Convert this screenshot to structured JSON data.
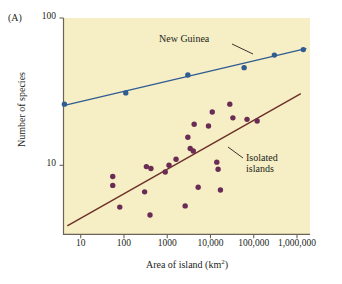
{
  "figure": {
    "panel_letter": "(A)",
    "xlabel_text": "Area of island (km",
    "xlabel_unit": "2",
    "xlabel_close": ")",
    "ylabel": "Number of species",
    "plot_bg_color": "#f6eec4",
    "axis_color": "#6b6456"
  },
  "annotations": {
    "new_guinea": "New Guinea",
    "isolated_line1": "Isolated",
    "isolated_line2": "islands"
  },
  "chart_data": {
    "type": "scatter",
    "title": "",
    "xlabel": "Area of island (km2)",
    "ylabel": "Number of species",
    "xscale": "log",
    "yscale": "log",
    "xlim": [
      4,
      2000000
    ],
    "ylim": [
      3.4,
      100
    ],
    "grid": false,
    "legend": "inline-annotations",
    "xticks": [
      10,
      100,
      1000,
      10000,
      100000,
      1000000
    ],
    "xticklabels": [
      "10",
      "100",
      "1000",
      "10,000",
      "100,000",
      "1,000,000"
    ],
    "yticks": [
      10,
      100
    ],
    "yticklabels": [
      "10",
      "100"
    ],
    "series": [
      {
        "name": "New Guinea",
        "color": "#2f5c93",
        "marker": "circle",
        "points": [
          {
            "x": 4.2,
            "y": 26
          },
          {
            "x": 110,
            "y": 31
          },
          {
            "x": 3000,
            "y": 41
          },
          {
            "x": 60000,
            "y": 46
          },
          {
            "x": 300000,
            "y": 56
          },
          {
            "x": 1400000,
            "y": 61
          }
        ],
        "trendline": {
          "x1": 4.2,
          "y1": 25.5,
          "x2": 1600000,
          "y2": 62,
          "color": "#2f5c93"
        }
      },
      {
        "name": "Isolated islands",
        "color": "#6a2c55",
        "marker": "circle",
        "points": [
          {
            "x": 55,
            "y": 8.4
          },
          {
            "x": 55,
            "y": 7.3
          },
          {
            "x": 80,
            "y": 5.2
          },
          {
            "x": 300,
            "y": 6.6
          },
          {
            "x": 330,
            "y": 9.8
          },
          {
            "x": 420,
            "y": 9.5
          },
          {
            "x": 400,
            "y": 4.6
          },
          {
            "x": 900,
            "y": 9.0
          },
          {
            "x": 1100,
            "y": 10.0
          },
          {
            "x": 1600,
            "y": 11.0
          },
          {
            "x": 2600,
            "y": 5.3
          },
          {
            "x": 3000,
            "y": 15.5
          },
          {
            "x": 3400,
            "y": 13.0
          },
          {
            "x": 4000,
            "y": 12.5
          },
          {
            "x": 4200,
            "y": 19.0
          },
          {
            "x": 5200,
            "y": 7.1
          },
          {
            "x": 9000,
            "y": 18.5
          },
          {
            "x": 11000,
            "y": 23.0
          },
          {
            "x": 14000,
            "y": 10.5
          },
          {
            "x": 15000,
            "y": 9.4
          },
          {
            "x": 17000,
            "y": 6.8
          },
          {
            "x": 28000,
            "y": 26.0
          },
          {
            "x": 33000,
            "y": 21.0
          },
          {
            "x": 70000,
            "y": 20.5
          },
          {
            "x": 120000,
            "y": 20.0
          }
        ],
        "trendline": {
          "x1": 5.0,
          "y1": 3.9,
          "x2": 1200000,
          "y2": 30.5,
          "color": "#6b2f27"
        }
      }
    ]
  }
}
